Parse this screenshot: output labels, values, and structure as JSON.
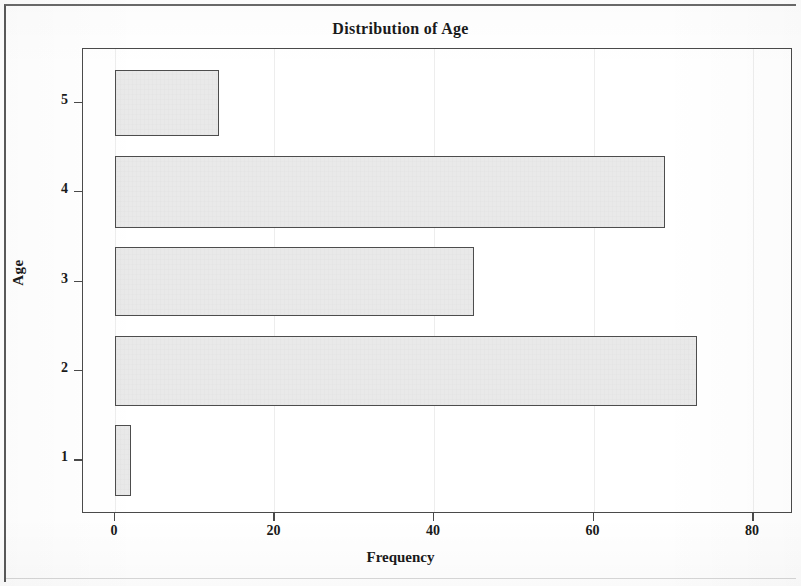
{
  "chart_data": {
    "type": "bar",
    "orientation": "horizontal",
    "title": "Distribution of Age",
    "xlabel": "Frequency",
    "ylabel": "Age",
    "categories": [
      "1",
      "2",
      "3",
      "4",
      "5"
    ],
    "values": [
      2,
      73,
      45,
      69,
      13
    ],
    "xlim": [
      -4,
      85
    ],
    "ylim": [
      0.4,
      5.6
    ],
    "xticks": [
      0,
      20,
      40,
      60,
      80
    ],
    "xticklabels": [
      "0",
      "20",
      "40",
      "60",
      "80"
    ],
    "yticks": [
      1,
      2,
      3,
      4,
      5
    ],
    "yticklabels": [
      "1",
      "2",
      "3",
      "4",
      "5"
    ],
    "grid": "faint vertical gridlines at x ticks",
    "legend": "none",
    "bar_fill_color": "#e9e9e9",
    "bar_edge_color": "#4d4d4d",
    "axis_color": "#4a4a4a",
    "background_color": "#ffffff",
    "bars": [
      {
        "category": "5",
        "value": 13,
        "bar_height_fraction": 0.74
      },
      {
        "category": "4",
        "value": 69,
        "bar_height_fraction": 0.8
      },
      {
        "category": "3",
        "value": 45,
        "bar_height_fraction": 0.78
      },
      {
        "category": "2",
        "value": 73,
        "bar_height_fraction": 0.79
      },
      {
        "category": "1",
        "value": 2,
        "bar_height_fraction": 0.8
      }
    ]
  }
}
